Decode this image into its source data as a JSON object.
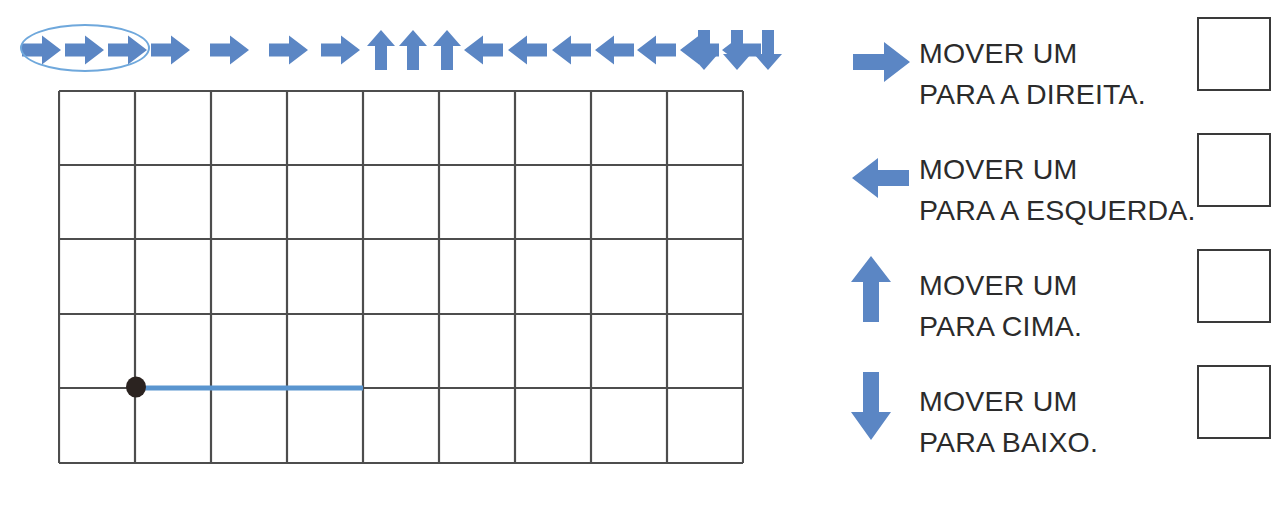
{
  "page": {
    "language": "pt-BR",
    "background_color": "#ffffff"
  },
  "colors": {
    "arrow_blue": "#5b86c4",
    "ellipse_blue": "#6fa8dc",
    "grid_line": "#4d4d4d",
    "path_blue": "#5a95cf",
    "marker_black": "#2b2320",
    "text_dark": "#2b2b2b",
    "box_border": "#3a3a3a"
  },
  "arrow_sequence": {
    "name": "command-sequence",
    "total": 20,
    "commands": [
      {
        "index": 1,
        "direction": "right",
        "icon": "arrow-right-icon",
        "selected": true
      },
      {
        "index": 2,
        "direction": "right",
        "icon": "arrow-right-icon",
        "selected": true
      },
      {
        "index": 3,
        "direction": "right",
        "icon": "arrow-right-icon",
        "selected": true
      },
      {
        "index": 4,
        "direction": "right",
        "icon": "arrow-right-icon",
        "selected": false
      },
      {
        "index": 5,
        "direction": "right",
        "icon": "arrow-right-icon",
        "selected": false
      },
      {
        "index": 6,
        "direction": "right",
        "icon": "arrow-right-icon",
        "selected": false
      },
      {
        "index": 7,
        "direction": "right",
        "icon": "arrow-right-icon",
        "selected": false
      },
      {
        "index": 8,
        "direction": "up",
        "icon": "arrow-up-icon",
        "selected": false
      },
      {
        "index": 9,
        "direction": "up",
        "icon": "arrow-up-icon",
        "selected": false
      },
      {
        "index": 10,
        "direction": "up",
        "icon": "arrow-up-icon",
        "selected": false
      },
      {
        "index": 11,
        "direction": "left",
        "icon": "arrow-left-icon",
        "selected": false
      },
      {
        "index": 12,
        "direction": "left",
        "icon": "arrow-left-icon",
        "selected": false
      },
      {
        "index": 13,
        "direction": "left",
        "icon": "arrow-left-icon",
        "selected": false
      },
      {
        "index": 14,
        "direction": "left",
        "icon": "arrow-left-icon",
        "selected": false
      },
      {
        "index": 15,
        "direction": "left",
        "icon": "arrow-left-icon",
        "selected": false
      },
      {
        "index": 16,
        "direction": "left",
        "icon": "arrow-left-icon",
        "selected": false
      },
      {
        "index": 17,
        "direction": "left",
        "icon": "arrow-left-icon",
        "selected": false
      },
      {
        "index": 18,
        "direction": "down",
        "icon": "arrow-down-icon",
        "selected": false
      },
      {
        "index": 19,
        "direction": "down",
        "icon": "arrow-down-icon",
        "selected": false
      },
      {
        "index": 20,
        "direction": "down",
        "icon": "arrow-down-icon",
        "selected": false
      }
    ],
    "counts": {
      "right": 7,
      "up": 3,
      "left": 7,
      "down": 3
    },
    "selection_highlight": {
      "name": "selection-ellipse",
      "shape": "ellipse",
      "covers_commands": [
        1,
        2,
        3
      ]
    }
  },
  "grid": {
    "name": "coordinate-grid",
    "columns": 9,
    "rows": 5,
    "cell_width": 76,
    "cell_height": 74.6,
    "start_marker": {
      "name": "start-point-marker",
      "shape": "filled-circle",
      "col": 1,
      "row": 4,
      "radius": 9
    },
    "drawn_path": {
      "name": "drawn-path",
      "from": {
        "col": 1,
        "row": 4
      },
      "to": {
        "col": 4,
        "row": 4
      },
      "direction": "right",
      "cells_traversed": 3
    }
  },
  "legend": {
    "name": "command-legend",
    "items": [
      {
        "direction": "right",
        "icon": "arrow-right-icon",
        "line1": "MOVER UM",
        "line2": "PARA A DIREITA.",
        "has_box": true
      },
      {
        "direction": "left",
        "icon": "arrow-left-icon",
        "line1": "MOVER UM",
        "line2": "PARA A ESQUERDA.",
        "has_box": true
      },
      {
        "direction": "up",
        "icon": "arrow-up-icon",
        "line1": "MOVER UM",
        "line2": "PARA CIMA.",
        "has_box": true
      },
      {
        "direction": "down",
        "icon": "arrow-down-icon",
        "line1": "MOVER UM",
        "line2": "PARA BAIXO.",
        "has_box": true
      }
    ]
  }
}
